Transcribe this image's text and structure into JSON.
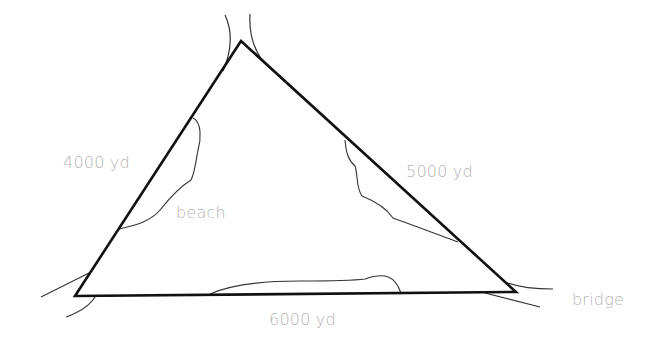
{
  "diagram": {
    "type": "triangle-geometry-word-problem",
    "triangle": {
      "vertices": {
        "top": [
          241,
          41
        ],
        "bottom_left": [
          75,
          296
        ],
        "bottom_right": [
          516,
          292
        ]
      },
      "stroke_color": "#111111"
    },
    "labels": {
      "side_left": "4000 yd",
      "side_right": "5000 yd",
      "side_bottom": "6000 yd",
      "beach": "beach",
      "bridge": "bridge"
    },
    "side_lengths": {
      "left": 4000,
      "right": 5000,
      "bottom": 6000,
      "unit": "yd"
    },
    "colors": {
      "label_text": "#b4b4b4",
      "lines": "#111111",
      "shoreline": "#333333"
    }
  }
}
